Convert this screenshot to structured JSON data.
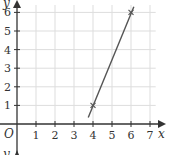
{
  "chart_data": {
    "type": "line",
    "title": "",
    "xlabel": "x",
    "ylabel": "y",
    "origin_label": "O",
    "xlim": [
      0,
      7
    ],
    "ylim": [
      0,
      6
    ],
    "grid": true,
    "x_ticks": [
      "1",
      "2",
      "3",
      "4",
      "5",
      "6",
      "7"
    ],
    "y_ticks": [
      "1",
      "2",
      "3",
      "4",
      "5",
      "6"
    ],
    "series": [
      {
        "name": "line",
        "points": [
          {
            "x": 4,
            "y": 1,
            "marker": "x"
          },
          {
            "x": 6,
            "y": 6,
            "marker": "x"
          }
        ],
        "extended_from": {
          "x": 3.75,
          "y": 0.35
        },
        "extended_to": {
          "x": 6.15,
          "y": 6.3
        }
      }
    ],
    "second_axis_label_partial": "y"
  },
  "colors": {
    "axis": "#333333",
    "grid": "#dddddd",
    "line": "#555555"
  }
}
